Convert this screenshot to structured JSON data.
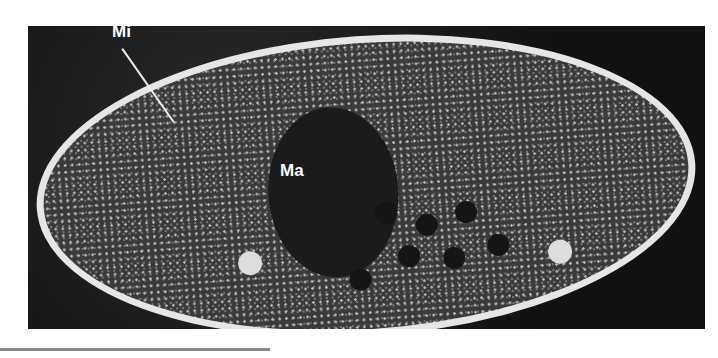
{
  "figure": {
    "labels": {
      "micronucleus": "Mi",
      "macronucleus": "Ma"
    }
  }
}
